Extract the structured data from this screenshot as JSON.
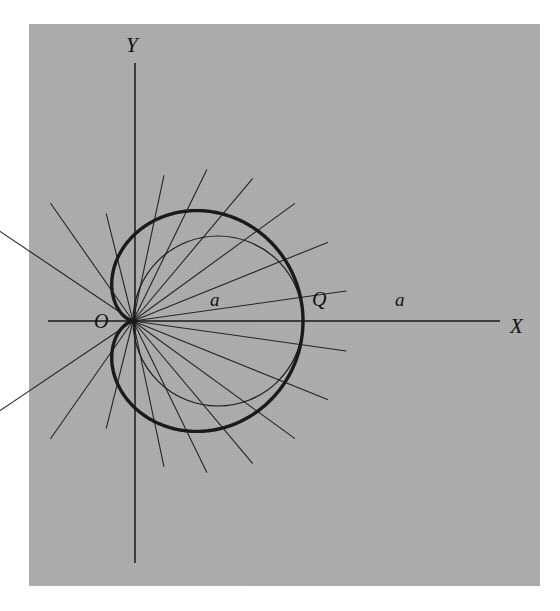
{
  "figure": {
    "kind": "cardioid-construction-diagram",
    "background_color": "#ffffff",
    "panel_color": "#adadad",
    "ink_color": "#1a1a1a",
    "panel": {
      "x": 29,
      "y": 24,
      "width": 511,
      "height": 562
    }
  },
  "labels": {
    "y_axis": "Y",
    "x_axis": "X",
    "origin": "O",
    "circle_center": "Q",
    "segment_left": "a",
    "segment_right": "a"
  },
  "chart_data": {
    "type": "line",
    "title": "",
    "subtitle": "",
    "xlabel": "X",
    "ylabel": "Y",
    "grid": false,
    "legend": false,
    "geometry": {
      "origin_px": [
        133,
        321
      ],
      "a_px": 85,
      "axes": {
        "x_axis": {
          "x1": 48,
          "y1": 321,
          "x2": 500,
          "y2": 321,
          "label": "X",
          "label_px": [
            510,
            314
          ]
        },
        "y_axis": {
          "x1": 135,
          "y1": 63,
          "x2": 135,
          "y2": 563,
          "label": "Y",
          "label_px": [
            126,
            33
          ]
        }
      },
      "generating_circle": {
        "center_px": [
          218,
          321
        ],
        "radius_px": 85,
        "center_label": "Q",
        "center_label_px": [
          312,
          288
        ],
        "description": "circle of diameter 2a through the cusp O with centre Q on the X axis"
      },
      "cardioid": {
        "equation": "r = a(1 + cos(theta))",
        "a": 85,
        "cusp_px": [
          133,
          321
        ],
        "rightmost_px": [
          473,
          321
        ],
        "topmost_px": [
          258,
          93
        ],
        "bottommost_px": [
          258,
          549
        ],
        "leftmost_px": [
          95,
          321
        ],
        "stroke_width": 3.4
      },
      "chord_angles_deg": [
        -78,
        -64,
        -50,
        -36,
        -22,
        -8,
        8,
        22,
        36,
        50,
        64,
        78,
        104,
        125,
        146,
        214,
        235,
        256
      ],
      "chord_overshoot_px": 46,
      "chord_stroke_width": 1.1,
      "note": "each ray from O meets the generating circle at P and is extended a constant distance a beyond, tracing the cardioid"
    },
    "annotations": [
      {
        "text": "a",
        "x_px": 210,
        "y_px": 289,
        "meaning": "distance from O to Q equals a"
      },
      {
        "text": "Q",
        "x_px": 312,
        "y_px": 288,
        "meaning": "centre of the generating circle"
      },
      {
        "text": "a",
        "x_px": 395,
        "y_px": 289,
        "meaning": "distance from Q to the cardioid vertex equals a"
      },
      {
        "text": "O",
        "x_px": 94,
        "y_px": 310,
        "meaning": "origin / cusp of the cardioid"
      }
    ]
  }
}
